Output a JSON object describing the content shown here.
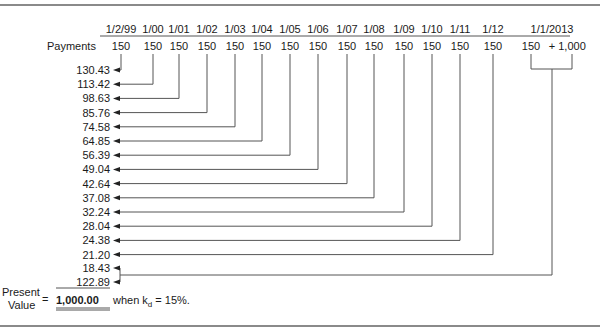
{
  "diagram": {
    "type": "present-value-timeline",
    "payments_label": "Payments",
    "columns": [
      {
        "date": "1/2/99",
        "payment": "150",
        "x": 121,
        "pv": "130.43"
      },
      {
        "date": "1/00",
        "payment": "150",
        "x": 153,
        "pv": "113.42"
      },
      {
        "date": "1/01",
        "payment": "150",
        "x": 179,
        "pv": "98.63"
      },
      {
        "date": "1/02",
        "payment": "150",
        "x": 207,
        "pv": "85.76"
      },
      {
        "date": "1/03",
        "payment": "150",
        "x": 235,
        "pv": "74.58"
      },
      {
        "date": "1/04",
        "payment": "150",
        "x": 262,
        "pv": "64.85"
      },
      {
        "date": "1/05",
        "payment": "150",
        "x": 290,
        "pv": "56.39"
      },
      {
        "date": "1/06",
        "payment": "150",
        "x": 318,
        "pv": "49.04"
      },
      {
        "date": "1/07",
        "payment": "150",
        "x": 347,
        "pv": "42.64"
      },
      {
        "date": "1/08",
        "payment": "150",
        "x": 374,
        "pv": "37.08"
      },
      {
        "date": "1/09",
        "payment": "150",
        "x": 404,
        "pv": "32.24"
      },
      {
        "date": "1/10",
        "payment": "150",
        "x": 432,
        "pv": "28.04"
      },
      {
        "date": "1/11",
        "payment": "150",
        "x": 460,
        "pv": "24.38"
      },
      {
        "date": "1/12",
        "payment": "150",
        "x": 493,
        "pv": "21.20"
      }
    ],
    "final": {
      "date": "1/1/2013",
      "payment": "150",
      "plus": "+",
      "principal": "1,000",
      "pv_coupon": "18.43",
      "pv_principal": "122.89"
    },
    "result": {
      "label_line1": "Present",
      "label_line2": "Value",
      "equals": "=",
      "value": "1,000.00",
      "when_text": "when k",
      "subscript": "d",
      "rate_text": " = 15%."
    }
  }
}
